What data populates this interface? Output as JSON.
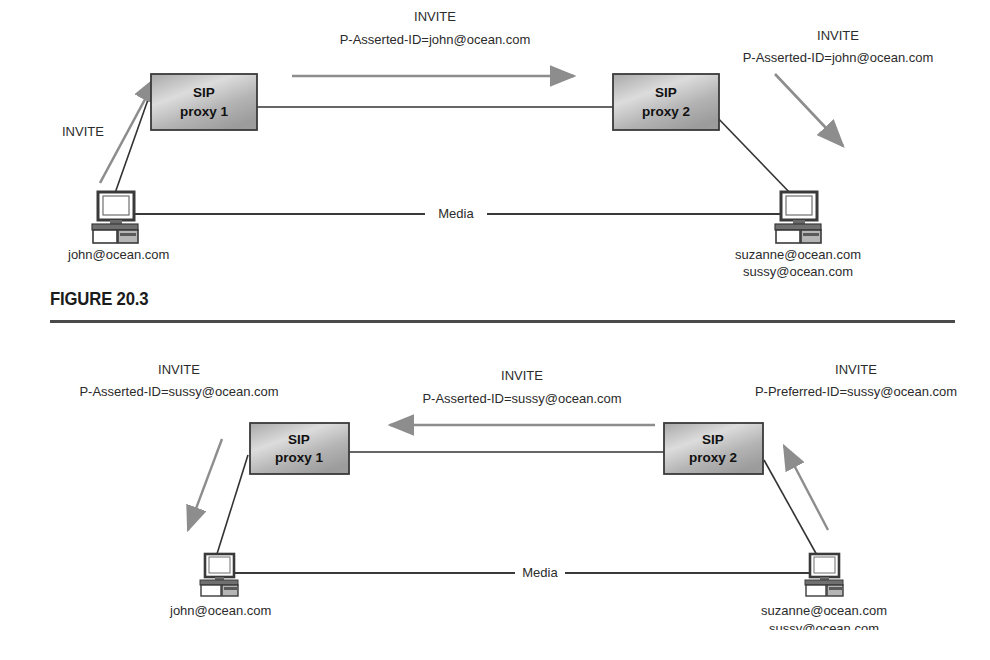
{
  "page": {
    "background": "#ffffff",
    "width": 990,
    "height": 660
  },
  "colors": {
    "signal_arrow": "#8a8a8a",
    "link_line": "#333333",
    "box_border": "#3a3a3a",
    "box_fill_light": "#d8d8d8",
    "box_fill_dark": "#9a9a9a",
    "text": "#2b2b2b",
    "rule": "#4a4a4a"
  },
  "figures": [
    {
      "id": "figure-20-3",
      "caption": "FIGURE 20.3",
      "nodes": {
        "proxy1": {
          "line1": "SIP",
          "line2": "proxy 1"
        },
        "proxy2": {
          "line1": "SIP",
          "line2": "proxy 2"
        },
        "left_user": {
          "labels": [
            "john@ocean.com"
          ]
        },
        "right_user": {
          "labels": [
            "suzanne@ocean.com",
            "sussy@ocean.com"
          ]
        }
      },
      "media_label": "Media",
      "signals": [
        {
          "name": "left-invite",
          "lines": [
            "INVITE"
          ],
          "direction": "up-right"
        },
        {
          "name": "middle-invite",
          "lines": [
            "INVITE",
            "P-Asserted-ID=john@ocean.com"
          ],
          "direction": "right"
        },
        {
          "name": "right-invite",
          "lines": [
            "INVITE",
            "P-Asserted-ID=john@ocean.com"
          ],
          "direction": "down-right"
        }
      ]
    },
    {
      "id": "figure-20-4",
      "caption": "FIGURE 20.4",
      "nodes": {
        "proxy1": {
          "line1": "SIP",
          "line2": "proxy 1"
        },
        "proxy2": {
          "line1": "SIP",
          "line2": "proxy 2"
        },
        "left_user": {
          "labels": [
            "john@ocean.com"
          ]
        },
        "right_user": {
          "labels": [
            "suzanne@ocean.com",
            "sussy@ocean.com"
          ]
        }
      },
      "media_label": "Media",
      "signals": [
        {
          "name": "left-invite",
          "lines": [
            "INVITE",
            "P-Asserted-ID=sussy@ocean.com"
          ],
          "direction": "down-left"
        },
        {
          "name": "middle-invite",
          "lines": [
            "INVITE",
            "P-Asserted-ID=sussy@ocean.com"
          ],
          "direction": "left"
        },
        {
          "name": "right-invite",
          "lines": [
            "INVITE",
            "P-Preferred-ID=sussy@ocean.com"
          ],
          "direction": "up-left"
        }
      ]
    }
  ]
}
